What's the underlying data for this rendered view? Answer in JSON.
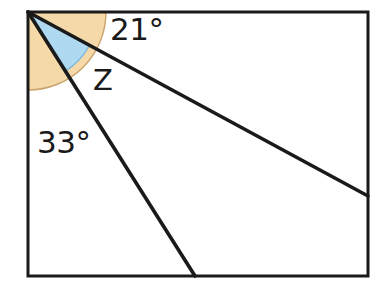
{
  "figure": {
    "canvas": {
      "width": 380,
      "height": 295,
      "background": "#ffffff"
    }
  },
  "colors": {
    "stroke": "#1a1a1a",
    "orange_sector_fill": "#f5d9a8",
    "orange_sector_stroke": "#c9a46a",
    "blue_sector_fill": "#aed9f0",
    "blue_sector_stroke": "#7fb8dd",
    "label_text": "#1a1a1a",
    "background": "#ffffff"
  },
  "rectangle": {
    "name": "bounding-rectangle",
    "top_left": {
      "x": 28,
      "y": 12
    },
    "bottom_right": {
      "x": 368,
      "y": 276
    },
    "stroke_width": 3
  },
  "vertex": {
    "name": "corner-vertex",
    "x": 28,
    "y": 12
  },
  "rays": [
    {
      "name": "upper-ray",
      "from": {
        "x": 28,
        "y": 12
      },
      "to": {
        "x": 368,
        "y": 196
      },
      "angle_below_horizontal_deg": 28
    },
    {
      "name": "lower-ray",
      "from": {
        "x": 28,
        "y": 12
      },
      "to": {
        "x": 195,
        "y": 276
      },
      "angle_below_horizontal_deg": 58
    }
  ],
  "sectors": [
    {
      "name": "orange-sector",
      "fill": "#f5d9a8",
      "radius": 78,
      "start_angle_deg": 0,
      "end_angle_deg": 90,
      "description": "quarter disc spanning the full right angle at the corner"
    },
    {
      "name": "blue-sector",
      "fill": "#aed9f0",
      "radius": 70,
      "start_angle_deg": 28,
      "end_angle_deg": 58,
      "description": "sector between the two diagonal rays, the angle labelled Z"
    }
  ],
  "labels": {
    "angle_top": "21°",
    "angle_unknown": "Z",
    "angle_bottom": "33°"
  },
  "chart_data": {
    "type": "diagram",
    "annotations": [
      "21°",
      "Z",
      "33°"
    ],
    "known_angles_deg": [
      21,
      33
    ],
    "unknown_angle_label": "Z",
    "total_corner_angle_deg": 90
  }
}
